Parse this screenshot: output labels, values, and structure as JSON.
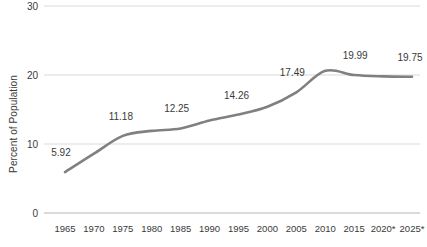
{
  "chart_data": {
    "type": "line",
    "title": "",
    "xlabel": "",
    "ylabel": "Percent of Population",
    "ylim": [
      0,
      30
    ],
    "yticks": [
      0,
      10,
      20,
      30
    ],
    "grid": true,
    "legend": "none",
    "line_color": "#808080",
    "categories": [
      "1965",
      "1970",
      "1975",
      "1980",
      "1985",
      "1990",
      "1995",
      "2000",
      "2005",
      "2010",
      "2015",
      "2020*",
      "2025*"
    ],
    "values": [
      5.92,
      8.6,
      11.18,
      11.9,
      12.25,
      13.4,
      14.26,
      15.4,
      17.49,
      20.6,
      19.99,
      19.8,
      19.75
    ],
    "point_labels": [
      {
        "category": "1965",
        "text": "5.92"
      },
      {
        "category": "1975",
        "text": "11.18"
      },
      {
        "category": "1985",
        "text": "12.25"
      },
      {
        "category": "1995",
        "text": "14.26"
      },
      {
        "category": "2005",
        "text": "17.49"
      },
      {
        "category": "2015",
        "text": "19.99"
      },
      {
        "category": "2025*",
        "text": "19.75"
      }
    ]
  }
}
